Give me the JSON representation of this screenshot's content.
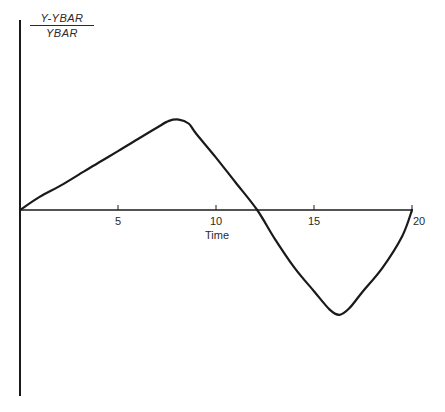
{
  "chart_data": {
    "type": "line",
    "title": "",
    "xlabel": "Time",
    "ylabel": "Y-YBAR / YBAR",
    "ylabel_numerator": "Y-YBAR",
    "ylabel_denominator": "YBAR",
    "xlim": [
      0,
      20
    ],
    "xticks": [
      5,
      10,
      15,
      20
    ],
    "xtick_labels": [
      "5",
      "10",
      "15",
      "20"
    ],
    "yticks": [],
    "grid": false,
    "legend": null,
    "series": [
      {
        "name": "deviation",
        "x": [
          0,
          1,
          2,
          3,
          4,
          5,
          6,
          7,
          7.6,
          8.1,
          8.6,
          9,
          10,
          11,
          12.1,
          13,
          14,
          15,
          15.8,
          16.3,
          16.8,
          17.5,
          18.5,
          19.5,
          20
        ],
        "y": [
          0,
          0.1,
          0.18,
          0.27,
          0.36,
          0.45,
          0.54,
          0.63,
          0.68,
          0.69,
          0.66,
          0.58,
          0.4,
          0.21,
          0.0,
          -0.22,
          -0.44,
          -0.62,
          -0.76,
          -0.8,
          -0.75,
          -0.62,
          -0.44,
          -0.2,
          0.0
        ]
      }
    ],
    "color": "#1a1a1a"
  }
}
